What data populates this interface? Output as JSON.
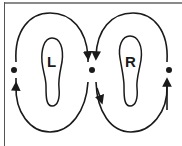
{
  "diagram": {
    "title": "",
    "feet": [
      {
        "id": "left",
        "label": "L"
      },
      {
        "id": "right",
        "label": "R"
      }
    ],
    "points": [
      {
        "id": "left-point",
        "x": 14,
        "y": 70
      },
      {
        "id": "center-point",
        "x": 92,
        "y": 70
      },
      {
        "id": "right-point",
        "x": 169,
        "y": 70
      }
    ],
    "pattern": "figure-eight around both feet",
    "colors": {
      "stroke": "#1a1a1a",
      "border": "#8a8a8a",
      "background": "#ffffff"
    }
  }
}
